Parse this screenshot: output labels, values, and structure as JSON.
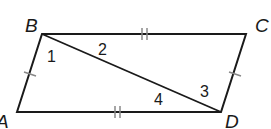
{
  "diagram": {
    "type": "parallelogram-with-diagonal",
    "vertices": {
      "A": {
        "label": "A",
        "x": 17,
        "y": 112
      },
      "B": {
        "label": "B",
        "x": 42,
        "y": 34
      },
      "C": {
        "label": "C",
        "x": 246,
        "y": 34
      },
      "D": {
        "label": "D",
        "x": 221,
        "y": 112
      }
    },
    "segments": [
      {
        "from": "A",
        "to": "B",
        "tick_marks": 1
      },
      {
        "from": "B",
        "to": "C",
        "tick_marks": 2
      },
      {
        "from": "C",
        "to": "D",
        "tick_marks": 1
      },
      {
        "from": "D",
        "to": "A",
        "tick_marks": 2
      },
      {
        "from": "B",
        "to": "D",
        "tick_marks": 0
      }
    ],
    "angle_labels": [
      "1",
      "2",
      "3",
      "4"
    ],
    "colors": {
      "line": "#1a1a1a",
      "tick": "#888888",
      "background": "#ffffff"
    }
  }
}
